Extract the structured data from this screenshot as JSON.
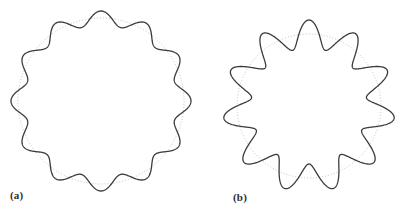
{
  "figure": {
    "background_color": "#ffffff",
    "curve_color": "#3c3c3c",
    "guide_color": "#b9b3b0",
    "curve_stroke_width": 1.3,
    "guide_stroke_width": 0.8,
    "guide_dash": "1,2"
  },
  "panels": [
    {
      "id": "a",
      "caption": "(a)",
      "curve_name": "wavy-circle-small-amplitude",
      "guide_name": "reference-circle-dotted",
      "center_x": 101,
      "center_y": 101,
      "mean_radius": 83,
      "amplitude": 7,
      "lobes": 12,
      "phase_deg": 90
    },
    {
      "id": "b",
      "caption": "(b)",
      "curve_name": "wavy-circle-large-amplitude",
      "guide_name": "reference-circle-dotted",
      "center_x": 309,
      "center_y": 106,
      "mean_radius": 72,
      "amplitude": 14,
      "lobes": 11,
      "phase_deg": 90
    }
  ],
  "chart_data": {
    "type": "line",
    "title": "",
    "series": [
      {
        "name": "(a) wavy circle",
        "equation": "r = 83 + 7*cos(12*theta)",
        "mean_radius": 83,
        "amplitude": 7,
        "lobes": 12,
        "min_radius": 76,
        "max_radius": 90
      },
      {
        "name": "(b) wavy circle",
        "equation": "r = 72 + 14*cos(11*theta)",
        "mean_radius": 72,
        "amplitude": 14,
        "lobes": 11,
        "min_radius": 58,
        "max_radius": 86
      }
    ],
    "annotations": [
      "(a)",
      "(b)"
    ],
    "grid": false,
    "legend": "none"
  }
}
